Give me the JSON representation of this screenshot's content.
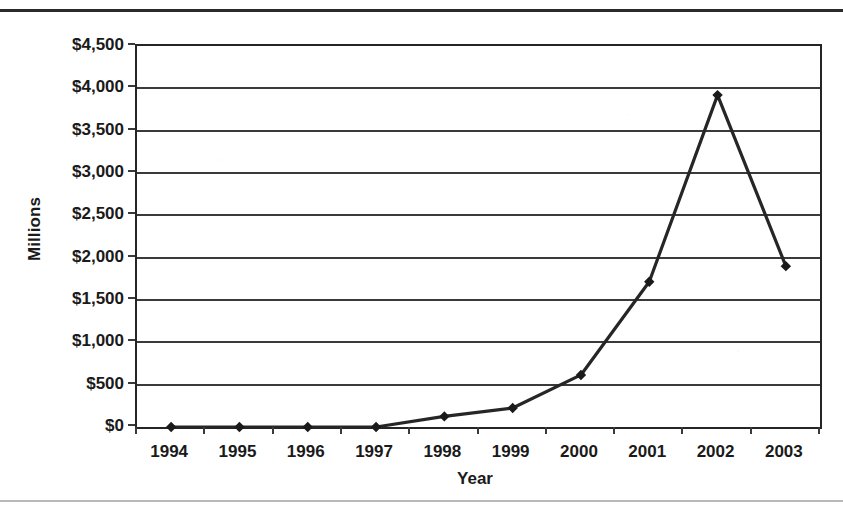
{
  "chart_data": {
    "type": "line",
    "title": "",
    "xlabel": "Year",
    "ylabel": "Millions",
    "categories": [
      "1994",
      "1995",
      "1996",
      "1997",
      "1998",
      "1999",
      "2000",
      "2001",
      "2002",
      "2003"
    ],
    "x": [
      1994,
      1995,
      1996,
      1997,
      1998,
      1999,
      2000,
      2001,
      2002,
      2003
    ],
    "values": [
      0,
      0,
      0,
      0,
      125,
      225,
      615,
      1715,
      3920,
      1900
    ],
    "series": [
      {
        "name": "",
        "values": [
          0,
          0,
          0,
          0,
          125,
          225,
          615,
          1715,
          3920,
          1900
        ]
      }
    ],
    "ylim": [
      0,
      4500
    ],
    "ytick_values": [
      0,
      500,
      1000,
      1500,
      2000,
      2500,
      3000,
      3500,
      4000,
      4500
    ],
    "ytick_labels": [
      "$0",
      "$500",
      "$1,000",
      "$1,500",
      "$2,000",
      "$2,500",
      "$3,000",
      "$3,500",
      "$4,000",
      "$4,500"
    ],
    "xtick_labels": [
      "1994",
      "1995",
      "1996",
      "1997",
      "1998",
      "1999",
      "2000",
      "2001",
      "2002",
      "2003"
    ],
    "grid": true,
    "grid_axis": "y",
    "legend": false,
    "legend_position": "none",
    "marker": "diamond",
    "line_color": "#262626",
    "marker_color": "#1a1a1a",
    "grid_color": "#3a3a3a",
    "axis_color": "#252525",
    "background_color": "#ffffff",
    "annotations": []
  },
  "axes": {
    "y_title": "Millions",
    "x_title": "Year"
  }
}
